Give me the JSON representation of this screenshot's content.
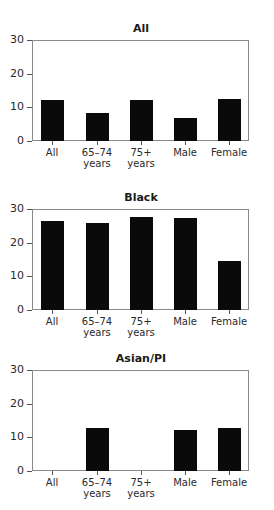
{
  "chart_data": [
    {
      "type": "bar",
      "title": "All",
      "categories": [
        "All",
        "65–74 years",
        "75+ years",
        "Male",
        "Female"
      ],
      "category_lines": [
        [
          "All",
          ""
        ],
        [
          "65–74",
          "years"
        ],
        [
          "75+",
          "years"
        ],
        [
          "Male",
          ""
        ],
        [
          "Female",
          ""
        ]
      ],
      "values": [
        12.1,
        8.4,
        12.2,
        6.9,
        12.6
      ],
      "xlabel": "",
      "ylabel": "",
      "ylim": [
        0,
        30
      ],
      "yticks": [
        0,
        10,
        20,
        30
      ],
      "grid": false,
      "legend": null
    },
    {
      "type": "bar",
      "title": "Black",
      "categories": [
        "All",
        "65–74 years",
        "75+ years",
        "Male",
        "Female"
      ],
      "category_lines": [
        [
          "All",
          ""
        ],
        [
          "65–74",
          "years"
        ],
        [
          "75+",
          "years"
        ],
        [
          "Male",
          ""
        ],
        [
          "Female",
          ""
        ]
      ],
      "values": [
        26.3,
        25.7,
        27.5,
        27.3,
        14.6
      ],
      "xlabel": "",
      "ylabel": "",
      "ylim": [
        0,
        30
      ],
      "yticks": [
        0,
        10,
        20,
        30
      ],
      "grid": false,
      "legend": null
    },
    {
      "type": "bar",
      "title": "Asian/PI",
      "categories": [
        "All",
        "65–74 years",
        "75+ years",
        "Male",
        "Female"
      ],
      "category_lines": [
        [
          "All",
          ""
        ],
        [
          "65–74",
          "years"
        ],
        [
          "75+",
          "years"
        ],
        [
          "Male",
          ""
        ],
        [
          "Female",
          ""
        ]
      ],
      "values": [
        null,
        12.9,
        null,
        12.2,
        12.9
      ],
      "xlabel": "",
      "ylabel": "",
      "ylim": [
        0,
        30
      ],
      "yticks": [
        0,
        10,
        20,
        30
      ],
      "grid": false,
      "legend": null
    }
  ],
  "style": {
    "bar_color": "#0a0a0a",
    "frame_color": "#8a8a8a"
  }
}
